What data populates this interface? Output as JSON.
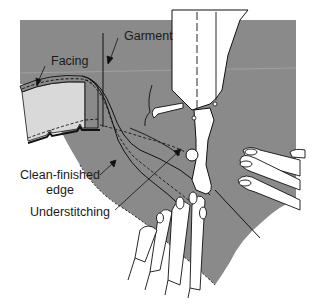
{
  "figure": {
    "colors": {
      "fabric": "#8a8a8a",
      "facing_underside": "#d9d9d9",
      "machine": "#ffffff",
      "ink": "#111111",
      "background": "#ffffff"
    }
  },
  "labels": {
    "garment": "Garment",
    "facing": "Facing",
    "clean_finished_line1": "Clean-finished",
    "clean_finished_line2": "edge",
    "understitching": "Understitching"
  }
}
